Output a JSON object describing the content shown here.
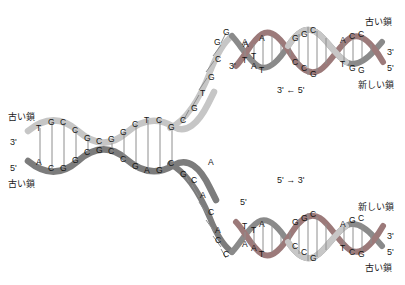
{
  "figure": {
    "title_semantic": "dna-replication-fork-diagram",
    "colors": {
      "old_strand_light": "#c9c9c9",
      "old_strand_dark": "#6e6e6e",
      "new_strand": "#9c7a7a",
      "text": "#131313",
      "background": "#ffffff"
    }
  },
  "labels": {
    "parent_top_left": "古い鎖",
    "parent_bottom_left": "古い鎖",
    "parent_left_three_prime": "3'",
    "parent_left_five_prime": "5'",
    "fork_top_three_prime": "3'",
    "fork_bottom_five_prime": "5'",
    "top_right_old": "古い鎖",
    "top_right_new": "新しい鎖",
    "top_right_three_prime": "3'",
    "top_right_five_prime": "5'",
    "bottom_right_new": "新しい鎖",
    "bottom_right_old": "古い鎖",
    "bottom_right_three_prime": "3'",
    "bottom_right_five_prime": "5'",
    "arrow_top": "3' ← 5'",
    "arrow_bottom": "5' → 3'"
  },
  "parent_duplex": {
    "description": "left parental double helix base pairs, top base over bottom base",
    "pairs": [
      {
        "top": "T",
        "bottom": "A"
      },
      {
        "top": "G",
        "bottom": "C"
      },
      {
        "top": "C",
        "bottom": "G"
      },
      {
        "top": "C",
        "bottom": "G"
      },
      {
        "top": "G",
        "bottom": "C"
      },
      {
        "top": "C",
        "bottom": "G"
      },
      {
        "top": "G",
        "bottom": "C"
      },
      {
        "top": "G",
        "bottom": "C"
      },
      {
        "top": "C",
        "bottom": "G"
      },
      {
        "top": "T",
        "bottom": "A"
      },
      {
        "top": "C",
        "bottom": "G"
      },
      {
        "top": "G",
        "bottom": "C"
      },
      {
        "top": "C",
        "bottom": "G"
      }
    ]
  },
  "fork_unpaired": {
    "top_branch_bases": [
      "G",
      "T",
      "G",
      "C",
      "G"
    ],
    "bottom_branch_bases": [
      "C",
      "A",
      "C",
      "A",
      "C"
    ],
    "top_tip_bases": [
      "A",
      "G"
    ],
    "bottom_tip_bases": [
      "C",
      "A"
    ]
  },
  "top_daughter_duplex": {
    "pairs": [
      {
        "top": "A",
        "bottom": "T"
      },
      {
        "top": "T",
        "bottom": "A"
      },
      {
        "top": "A",
        "bottom": "T"
      },
      {
        "top": "G",
        "bottom": "C"
      },
      {
        "top": "G",
        "bottom": "C"
      },
      {
        "top": "C",
        "bottom": "G"
      },
      {
        "top": "A",
        "bottom": "T"
      },
      {
        "top": "C",
        "bottom": "G"
      },
      {
        "top": "C",
        "bottom": "G"
      }
    ]
  },
  "bottom_daughter_duplex": {
    "pairs": [
      {
        "top": "T",
        "bottom": "A"
      },
      {
        "top": "T",
        "bottom": "A"
      },
      {
        "top": "A",
        "bottom": "T"
      },
      {
        "top": "G",
        "bottom": "C"
      },
      {
        "top": "G",
        "bottom": "C"
      },
      {
        "top": "C",
        "bottom": "G"
      },
      {
        "top": "A",
        "bottom": "T"
      },
      {
        "top": "G",
        "bottom": "C"
      },
      {
        "top": "C",
        "bottom": "G"
      }
    ]
  }
}
